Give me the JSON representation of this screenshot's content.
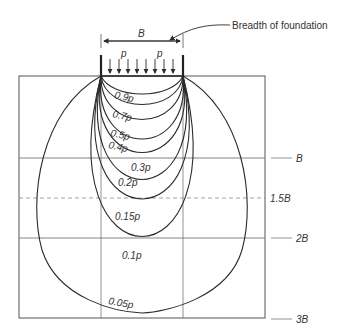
{
  "diagram": {
    "callout_label": "Breadth of foundation",
    "width_label": "B",
    "load_labels": [
      "p",
      "p"
    ],
    "depth_labels": [
      {
        "text": "B",
        "y": 158
      },
      {
        "text": "1.5B",
        "y": 198,
        "dashed": true
      },
      {
        "text": "2B",
        "y": 238
      },
      {
        "text": "3B",
        "y": 319
      }
    ],
    "bulbs": [
      {
        "label": "0.9p",
        "bottom_y": 106
      },
      {
        "label": "0.7p",
        "bottom_y": 118
      },
      {
        "label": "0.5p",
        "bottom_y": 132
      },
      {
        "label": "0.4p",
        "bottom_y": 148
      },
      {
        "label": "0.3p",
        "bottom_y": 162
      },
      {
        "label": "0.2p",
        "bottom_y": 190
      },
      {
        "label": "0.15p",
        "bottom_y": 210
      },
      {
        "label": "0.1p",
        "bottom_y": 249
      },
      {
        "label": "0.05p",
        "bottom_y": 313
      }
    ],
    "colors": {
      "line": "#2b2b2b",
      "grid": "#555555"
    }
  }
}
